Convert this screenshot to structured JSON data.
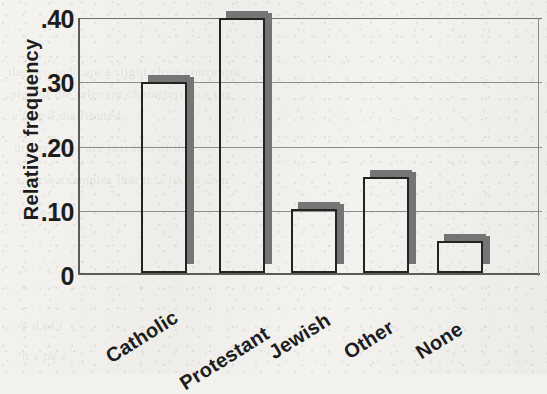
{
  "chart_data": {
    "type": "bar",
    "title": "",
    "subtitle": "",
    "xlabel": "",
    "ylabel": "Relative frequency",
    "categories": [
      "Catholic",
      "Protestant",
      "Jewish",
      "Other",
      "None"
    ],
    "values": [
      0.3,
      0.4,
      0.1,
      0.15,
      0.05
    ],
    "ylim": [
      0,
      0.4
    ],
    "ytick_labels": [
      "0",
      ".10",
      ".20",
      ".30",
      ".40"
    ],
    "ytick_values": [
      0,
      0.1,
      0.2,
      0.3,
      0.4
    ],
    "grid": "horizontal",
    "legend": "none",
    "bar_style": "3d-outline-with-gray-shadow",
    "xtick_rotation_degrees": -32,
    "colors": {
      "bar_outline": "#232323",
      "bar_fill": "transparent",
      "bar_shadow": "#757575",
      "axis": "#5b5b5b",
      "gridline": "#8d8d8d",
      "text": "#1d1d1d",
      "background": "#f1f0ed"
    }
  },
  "axis": {
    "y_title": "Relative frequency",
    "ticks": [
      {
        "label": ".40",
        "value": 0.4
      },
      {
        "label": ".30",
        "value": 0.3
      },
      {
        "label": ".20",
        "value": 0.2
      },
      {
        "label": ".10",
        "value": 0.1
      },
      {
        "label": "0",
        "value": 0.0
      }
    ]
  },
  "bars": [
    {
      "label": "Catholic",
      "value": 0.3
    },
    {
      "label": "Protestant",
      "value": 0.4
    },
    {
      "label": "Jewish",
      "value": 0.1
    },
    {
      "label": "Other",
      "value": 0.15
    },
    {
      "label": "None",
      "value": 0.05
    }
  ],
  "page_bleed_text": [
    "the two indicate a slight close concentra",
    "play of the relevant characteristics the",
    "e       ting a                 distributed",
    "urther                 these are just two of the",
    "s these examples that it is like a com",
    "ion                e                               e",
    "T                     d   of                         t",
    "h   a   na                                          e"
  ]
}
